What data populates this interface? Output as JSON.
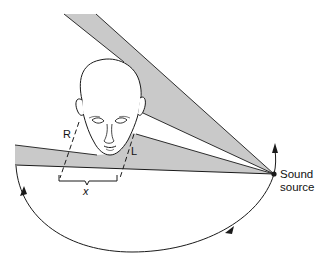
{
  "diagram": {
    "labels": {
      "right_ear": "R",
      "left_ear": "L",
      "interaural_distance": "x",
      "source_line1": "Sound",
      "source_line2": "source"
    },
    "elements": [
      "head (front view, bald)",
      "upper sound shadow wedge",
      "lower sound path wedge",
      "dashed ear-projection lines R and L",
      "brace indicating distance x",
      "semicircular arc with arrows showing source movement",
      "sound source point"
    ],
    "colors": {
      "wedge_fill": "#c9c9c9",
      "line": "#1a1a1a",
      "background": "#ffffff"
    }
  }
}
